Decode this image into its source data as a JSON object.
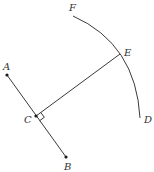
{
  "diagram": {
    "type": "geometry",
    "colors": {
      "stroke": "#3a3a3a",
      "point": "#1a1a1a",
      "label": "#333333",
      "background": "#ffffff"
    },
    "points": {
      "A": {
        "label": "A",
        "x": 7,
        "y": 75
      },
      "B": {
        "label": "B",
        "x": 66,
        "y": 157
      },
      "C": {
        "label": "C",
        "x": 36,
        "y": 116
      },
      "D": {
        "label": "D",
        "x": 140,
        "y": 118
      },
      "E": {
        "label": "E",
        "x": 120,
        "y": 54
      },
      "F": {
        "label": "F",
        "x": 73,
        "y": 16
      }
    },
    "segments": [
      {
        "from": "A",
        "to": "B"
      },
      {
        "from": "C",
        "to": "E"
      }
    ],
    "arcs": [
      {
        "from": "F",
        "through": "E",
        "to": "D"
      }
    ],
    "right_angle_at": "C"
  }
}
